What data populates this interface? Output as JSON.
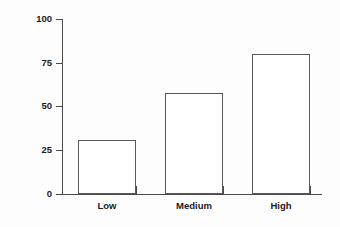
{
  "chart_data": {
    "type": "bar",
    "title": "",
    "subtitle": "",
    "xlabel": "",
    "ylabel": "Percent of Patients",
    "categories": [
      "Low",
      "Medium",
      "High"
    ],
    "values": [
      31,
      58,
      80
    ],
    "series": [
      {
        "name": "Percent of Patients",
        "values": [
          31,
          58,
          80
        ]
      }
    ],
    "ylim": [
      0,
      100
    ],
    "yticks": [
      0,
      25,
      50,
      75,
      100
    ],
    "ytick_labels": [
      "0",
      "25",
      "50",
      "75",
      "100"
    ],
    "grid": false,
    "legend": false,
    "legend_position": "none",
    "bar_fill_color": "#ffffff",
    "bar_edge_color": "#585858",
    "axis_color": "#4a4a4a",
    "text_color": "#1a1a1a",
    "background_color": "#fdfdfd",
    "annotations": []
  }
}
